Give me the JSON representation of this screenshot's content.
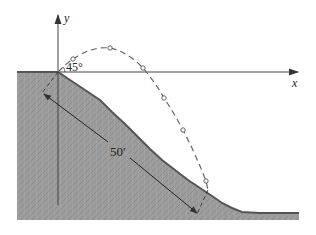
{
  "figure": {
    "type": "projectile-on-slope",
    "axes": {
      "x_label": "x",
      "y_label": "y"
    },
    "launch_angle_label": "45°",
    "slope_distance_label": "50′",
    "colors": {
      "ground_fill": "#9a9a9a",
      "ground_outline": "#555555",
      "axis": "#444444",
      "trajectory": "#666666",
      "dimension_line": "#333333"
    },
    "trajectory_markers": [
      {
        "x": 73,
        "y": 59
      },
      {
        "x": 110,
        "y": 48
      },
      {
        "x": 143,
        "y": 68
      },
      {
        "x": 164,
        "y": 98
      },
      {
        "x": 183,
        "y": 130
      },
      {
        "x": 206,
        "y": 181
      }
    ]
  }
}
